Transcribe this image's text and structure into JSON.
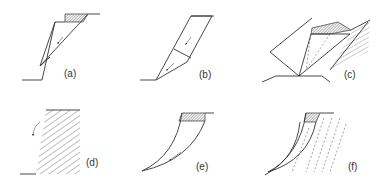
{
  "diagram": {
    "panels": [
      {
        "id": "a",
        "label": "(a)",
        "type": "plane failure"
      },
      {
        "id": "b",
        "label": "(b)",
        "type": "block / translational failure"
      },
      {
        "id": "c",
        "label": "(c)",
        "type": "wedge failure"
      },
      {
        "id": "d",
        "label": "(d)",
        "type": "toppling failure"
      },
      {
        "id": "e",
        "label": "(e)",
        "type": "circular failure"
      },
      {
        "id": "f",
        "label": "(f)",
        "type": "circular failure in jointed rock"
      }
    ],
    "colors": {
      "line": "#333333",
      "background": "#ffffff"
    }
  }
}
